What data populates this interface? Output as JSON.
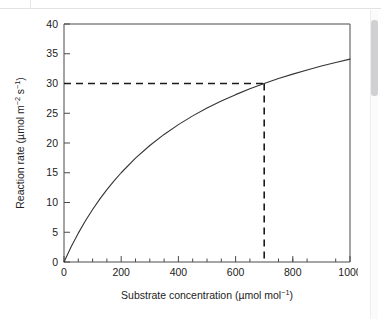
{
  "document": {
    "scrollbar": {
      "name": "vertical-scrollbar",
      "thumb_label": ""
    }
  },
  "chart_data": {
    "type": "line",
    "title": "",
    "subtitle": "",
    "xlabel": "Substrate concentration (µmol mol⁻¹)",
    "ylabel": "Reaction rate (µmol m⁻² s⁻¹)",
    "xlabel_parts": {
      "main": "Substrate concentration (µmol mol",
      "sup": "−1",
      "tail": ")"
    },
    "ylabel_parts": {
      "main": "Reaction rate (µmol m",
      "sup1": "−2",
      "mid": " s",
      "sup2": "−1",
      "tail": ")"
    },
    "xlim": [
      0,
      1000
    ],
    "ylim": [
      0,
      40
    ],
    "xticks": [
      0,
      200,
      400,
      600,
      800,
      1000
    ],
    "xticklabels": [
      "0",
      "200",
      "400",
      "600",
      "800",
      "1000"
    ],
    "xminorticks": [
      50,
      100,
      150,
      250,
      300,
      350,
      450,
      500,
      550,
      650,
      700,
      750,
      850,
      900,
      950
    ],
    "yticks": [
      0,
      5,
      10,
      15,
      20,
      25,
      30,
      35,
      40
    ],
    "yticklabels": [
      "0",
      "5",
      "10",
      "15",
      "20",
      "25",
      "30",
      "35",
      "40"
    ],
    "grid": false,
    "legend": null,
    "series": [
      {
        "name": "reaction rate curve",
        "color": "#333333",
        "style": "solid",
        "x": [
          0,
          25,
          50,
          75,
          100,
          125,
          150,
          175,
          200,
          250,
          300,
          350,
          400,
          450,
          500,
          550,
          600,
          650,
          700,
          750,
          800,
          850,
          900,
          950,
          1000
        ],
        "y": [
          0.0,
          2.55,
          4.85,
          6.93,
          8.83,
          10.57,
          12.17,
          13.64,
          15.0,
          17.45,
          19.58,
          21.44,
          23.09,
          24.56,
          25.87,
          27.06,
          28.13,
          29.11,
          30.0,
          30.83,
          31.58,
          32.28,
          32.93,
          33.53,
          34.09
        ]
      }
    ],
    "annotations": [
      {
        "name": "guide-line-horizontal",
        "type": "dashed-line",
        "orientation": "horizontal",
        "value": 30,
        "from_x": 0,
        "to_x": 700,
        "color": "#1a1a1a"
      },
      {
        "name": "guide-line-vertical",
        "type": "dashed-line",
        "orientation": "vertical",
        "value": 700,
        "from_y": 0,
        "to_y": 30,
        "color": "#1a1a1a"
      }
    ],
    "marked_point": {
      "x": 700,
      "y": 30
    }
  }
}
